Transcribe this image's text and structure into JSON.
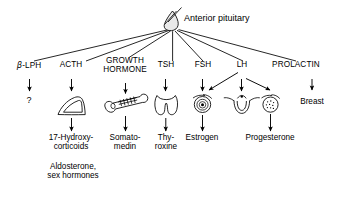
{
  "diagram": {
    "title": "Anterior pituitary",
    "source_gland": {
      "name": "Anterior pituitary",
      "icon": "pituitary-gland-icon"
    },
    "hormones": [
      {
        "id": "b-lph",
        "label": "β-LPH",
        "label_prefix": "β",
        "label_rest": "-LPH",
        "target_organ": null,
        "target_organ_icon": null,
        "product": "?",
        "product_lines": [
          "?"
        ]
      },
      {
        "id": "acth",
        "label": "ACTH",
        "target_organ": "Adrenal gland",
        "target_organ_icon": "adrenal-gland-icon",
        "product": "17-Hydroxy-corticoids",
        "product_lines": [
          "17-Hydroxy-",
          "corticoids"
        ],
        "secondary_product": "Aldosterone, sex hormones",
        "secondary_product_lines": [
          "Aldosterone,",
          "sex hormones"
        ]
      },
      {
        "id": "growth-hormone",
        "label": "GROWTH HORMONE",
        "label_lines": [
          "GROWTH",
          "HORMONE"
        ],
        "target_organ": "Bone",
        "target_organ_icon": "bone-icon",
        "product": "Somatomedin",
        "product_lines": [
          "Somato-",
          "medin"
        ]
      },
      {
        "id": "tsh",
        "label": "TSH",
        "target_organ": "Thyroid gland",
        "target_organ_icon": "thyroid-gland-icon",
        "product": "Thyroxine",
        "product_lines": [
          "Thy-",
          "roxine"
        ]
      },
      {
        "id": "fsh",
        "label": "FSH",
        "target_organ": "Ovarian follicle",
        "target_organ_icon": "ovarian-follicle-icon",
        "product": "Estrogen",
        "product_lines": [
          "Estrogen"
        ]
      },
      {
        "id": "lh",
        "label": "LH",
        "target_organ": "Ovary, uterus, corpus luteum",
        "target_organ_icon": "corpus-luteum-icon",
        "product": "Progesterone",
        "product_lines": [
          "Progesterone"
        ]
      },
      {
        "id": "prolactin",
        "label": "PROLACTIN",
        "target_organ": "Breast",
        "target_organ_icon": null,
        "product": "Breast",
        "product_lines": [
          "Breast"
        ]
      }
    ],
    "organ_labels": {
      "breast": "Breast"
    },
    "colors": {
      "stroke": "#000000",
      "text": "#000000",
      "background": "#ffffff",
      "gland_fill": "#e8e8e8"
    }
  }
}
